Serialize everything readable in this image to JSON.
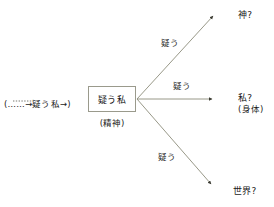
{
  "diagram": {
    "source_annotation": "(……→疑う私→)",
    "central_node": {
      "label": "疑う私",
      "sublabel": "(精神)"
    },
    "edges": [
      {
        "label": "疑う",
        "target": "神?"
      },
      {
        "label": "疑う",
        "target": "私?"
      },
      {
        "label": "疑う",
        "target": "世界?"
      }
    ],
    "targets": [
      {
        "label": "神?",
        "sublabel": ""
      },
      {
        "label": "私?",
        "sublabel": "(身体)"
      },
      {
        "label": "世界?",
        "sublabel": ""
      }
    ],
    "colors": {
      "line": "#8c8c7a",
      "box_border": "#9a9a8c",
      "text": "#1a1a1a",
      "background": "#ffffff"
    }
  }
}
